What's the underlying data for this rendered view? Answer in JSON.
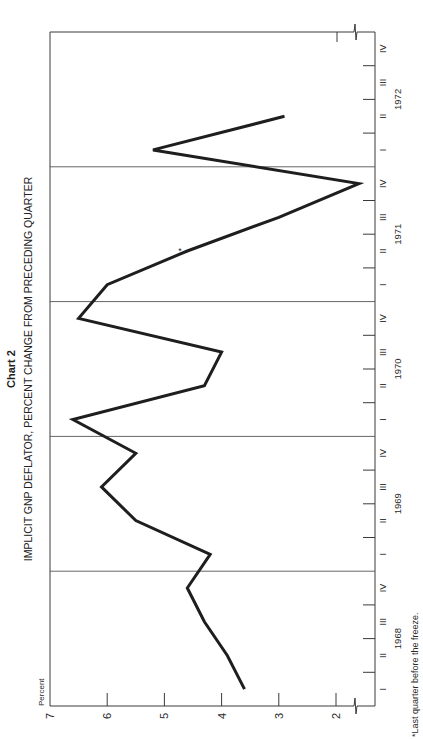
{
  "chart_data": {
    "type": "line",
    "title": "Chart 2",
    "subtitle": "IMPLICIT GNP DEFLATOR, PERCENT CHANGE FROM PRECEDING QUARTER",
    "orientation": "rotated 90° counterclockwise (value axis runs along bottom edge, time axis along right edge)",
    "ylabel": "Percent",
    "xlabel": "",
    "ylim": [
      1.5,
      7
    ],
    "y_ticks": [
      7,
      6,
      5,
      4,
      3,
      2
    ],
    "y_axis_break": "below 2",
    "grid": false,
    "year_divider_lines": true,
    "legend": null,
    "years": [
      "1968",
      "1969",
      "1970",
      "1971",
      "1972"
    ],
    "quarter_labels": [
      "I",
      "II",
      "III",
      "IV"
    ],
    "categories": [
      "1968 I",
      "1968 II",
      "1968 III",
      "1968 IV",
      "1969 I",
      "1969 II",
      "1969 III",
      "1969 IV",
      "1970 I",
      "1970 II",
      "1970 III",
      "1970 IV",
      "1971 I",
      "1971 II",
      "1971 III",
      "1971 IV",
      "1972 I",
      "1972 II"
    ],
    "series": [
      {
        "name": "Implicit GNP deflator, % change from preceding quarter",
        "values": [
          3.6,
          3.9,
          4.3,
          4.6,
          4.2,
          5.5,
          6.1,
          5.5,
          6.6,
          4.3,
          4.0,
          6.5,
          6.0,
          4.6,
          3.0,
          1.6,
          5.2,
          2.9
        ]
      }
    ],
    "annotations": [
      {
        "marker": "*",
        "at": "1971 II",
        "text": "*Last quarter before the freeze."
      }
    ],
    "footnote": "*Last quarter before the freeze."
  },
  "colors": {
    "line": "#1e1e1e",
    "axis": "#3a3a3a",
    "background": "#ffffff"
  }
}
